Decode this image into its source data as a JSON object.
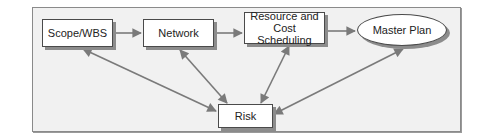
{
  "diagram": {
    "type": "flow",
    "nodes": [
      {
        "id": "scope",
        "label": "Scope/WBS",
        "shape": "rectangle"
      },
      {
        "id": "network",
        "label": "Network",
        "shape": "rectangle"
      },
      {
        "id": "resource",
        "label_line1": "Resource and Cost",
        "label_line2": "Scheduling",
        "shape": "rectangle"
      },
      {
        "id": "master",
        "label": "Master Plan",
        "shape": "ellipse"
      },
      {
        "id": "risk",
        "label": "Risk",
        "shape": "rectangle"
      }
    ],
    "edges": [
      {
        "from": "scope",
        "to": "network",
        "direction": "forward"
      },
      {
        "from": "network",
        "to": "resource",
        "direction": "forward"
      },
      {
        "from": "resource",
        "to": "master",
        "direction": "forward"
      },
      {
        "from": "scope",
        "to": "risk",
        "direction": "both"
      },
      {
        "from": "network",
        "to": "risk",
        "direction": "both"
      },
      {
        "from": "resource",
        "to": "risk",
        "direction": "both"
      },
      {
        "from": "master",
        "to": "risk",
        "direction": "both"
      }
    ],
    "colors": {
      "background": "#f1f1f1",
      "node_fill": "#ffffff",
      "node_border": "#4a4a4a",
      "arrow": "#7a7a7a",
      "shadow": "#8c8c8c"
    }
  }
}
